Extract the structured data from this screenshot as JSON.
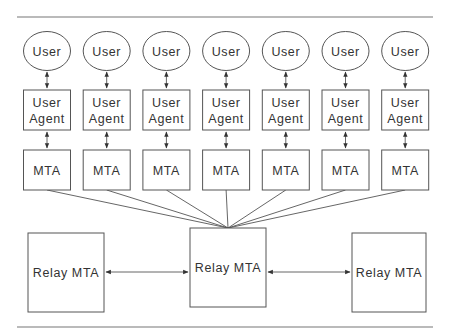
{
  "diagram": {
    "type": "mail-system-architecture",
    "columns": [
      {
        "user": "User",
        "agent_line1": "User",
        "agent_line2": "Agent",
        "mta": "MTA"
      },
      {
        "user": "User",
        "agent_line1": "User",
        "agent_line2": "Agent",
        "mta": "MTA"
      },
      {
        "user": "User",
        "agent_line1": "User",
        "agent_line2": "Agent",
        "mta": "MTA"
      },
      {
        "user": "User",
        "agent_line1": "User",
        "agent_line2": "Agent",
        "mta": "MTA"
      },
      {
        "user": "User",
        "agent_line1": "User",
        "agent_line2": "Agent",
        "mta": "MTA"
      },
      {
        "user": "User",
        "agent_line1": "User",
        "agent_line2": "Agent",
        "mta": "MTA"
      },
      {
        "user": "User",
        "agent_line1": "User",
        "agent_line2": "Agent",
        "mta": "MTA"
      }
    ],
    "relays": {
      "left": "Relay MTA",
      "center": "Relay MTA",
      "right": "Relay MTA"
    },
    "edges": [
      "User <-> User Agent (x7)",
      "User Agent <-> MTA (x7)",
      "MTA -- Relay MTA (center) (x7)",
      "Relay MTA (left) <-> Relay MTA (center)",
      "Relay MTA (center) <-> Relay MTA (right)"
    ]
  }
}
